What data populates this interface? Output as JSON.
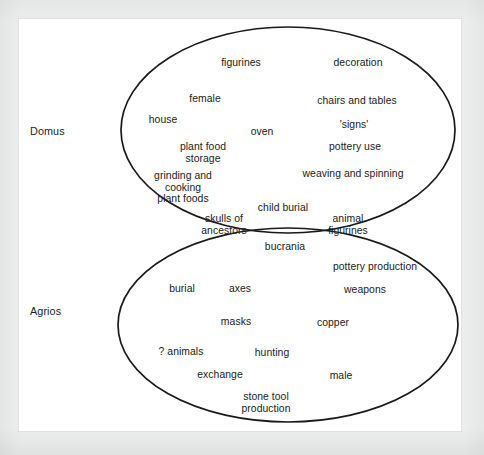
{
  "figure": {
    "background_color": "#eceded",
    "paper_color": "#ffffff",
    "stroke_color": "#1a1a1a",
    "text_color": "#212121"
  },
  "sets": [
    {
      "id": "domus",
      "name": "Domus",
      "label": "Domus",
      "label_x": 30,
      "label_y": 131,
      "ellipse": {
        "cx": 288,
        "cy": 130,
        "rx": 167,
        "ry": 103
      }
    },
    {
      "id": "agrios",
      "name": "Agrios",
      "label": "Agrios",
      "label_x": 30,
      "label_y": 311,
      "ellipse": {
        "cx": 288,
        "cy": 325,
        "rx": 170,
        "ry": 97
      }
    }
  ],
  "regions": {
    "domus_only": {
      "set": "Domus",
      "items": [
        {
          "text": "figurines",
          "x": 241,
          "y": 63
        },
        {
          "text": "decoration",
          "x": 358,
          "y": 63
        },
        {
          "text": "female",
          "x": 205,
          "y": 99
        },
        {
          "text": "chairs and tables",
          "x": 357,
          "y": 101
        },
        {
          "text": "house",
          "x": 163,
          "y": 120
        },
        {
          "text": "oven",
          "x": 262,
          "y": 132
        },
        {
          "text": "'signs'",
          "x": 354,
          "y": 125
        },
        {
          "text": "plant food\nstorage",
          "x": 203,
          "y": 153
        },
        {
          "text": "pottery use",
          "x": 355,
          "y": 147
        },
        {
          "text": "grinding and\ncooking\nplant foods",
          "x": 183,
          "y": 187
        },
        {
          "text": "weaving and spinning",
          "x": 353,
          "y": 174
        }
      ]
    },
    "intersection": {
      "sets": [
        "Domus",
        "Agrios"
      ],
      "items": [
        {
          "text": "child burial",
          "x": 283,
          "y": 208
        },
        {
          "text": "skulls of\nancestors",
          "x": 224,
          "y": 225
        },
        {
          "text": "animal\nfigurines",
          "x": 348,
          "y": 225
        },
        {
          "text": "bucrania",
          "x": 285,
          "y": 247
        }
      ]
    },
    "agrios_only": {
      "set": "Agrios",
      "items": [
        {
          "text": "pottery production",
          "x": 375,
          "y": 267
        },
        {
          "text": "burial",
          "x": 182,
          "y": 289
        },
        {
          "text": "axes",
          "x": 240,
          "y": 289
        },
        {
          "text": "weapons",
          "x": 365,
          "y": 290
        },
        {
          "text": "masks",
          "x": 236,
          "y": 322
        },
        {
          "text": "copper",
          "x": 333,
          "y": 323
        },
        {
          "text": "? animals",
          "x": 181,
          "y": 352
        },
        {
          "text": "hunting",
          "x": 272,
          "y": 353
        },
        {
          "text": "exchange",
          "x": 220,
          "y": 375
        },
        {
          "text": "male",
          "x": 341,
          "y": 376
        },
        {
          "text": "stone tool\nproduction",
          "x": 266,
          "y": 403
        }
      ]
    }
  }
}
